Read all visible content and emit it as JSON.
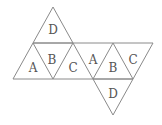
{
  "diagram": {
    "faces": [
      {
        "label": "D",
        "x": 53,
        "y": 31
      },
      {
        "label": "A",
        "x": 33,
        "y": 69
      },
      {
        "label": "B",
        "x": 52,
        "y": 61
      },
      {
        "label": "C",
        "x": 73,
        "y": 69
      },
      {
        "label": "A",
        "x": 93,
        "y": 61
      },
      {
        "label": "B",
        "x": 113,
        "y": 69
      },
      {
        "label": "C",
        "x": 133,
        "y": 61
      },
      {
        "label": "D",
        "x": 113,
        "y": 97
      }
    ],
    "colors": {
      "stroke": "#8a8a8a",
      "text": "#555555"
    }
  }
}
